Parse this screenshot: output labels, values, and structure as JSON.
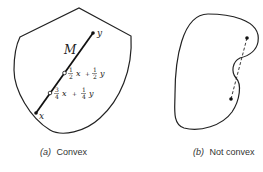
{
  "figures": [
    {
      "caption_prefix": "(a)",
      "caption_text": "Convex",
      "set_label": "M",
      "endpoint_x": "x",
      "endpoint_y": "y",
      "midpoint_label": {
        "c1_num": "1",
        "c1_den": "2",
        "v1": "x",
        "op": "+",
        "c2_num": "1",
        "c2_den": "2",
        "v2": "y"
      },
      "quarter_label": {
        "c1_num": "3",
        "c1_den": "4",
        "v1": "x",
        "op": "+",
        "c2_num": "1",
        "c2_den": "4",
        "v2": "y"
      }
    },
    {
      "caption_prefix": "(b)",
      "caption_text": "Not convex"
    }
  ]
}
